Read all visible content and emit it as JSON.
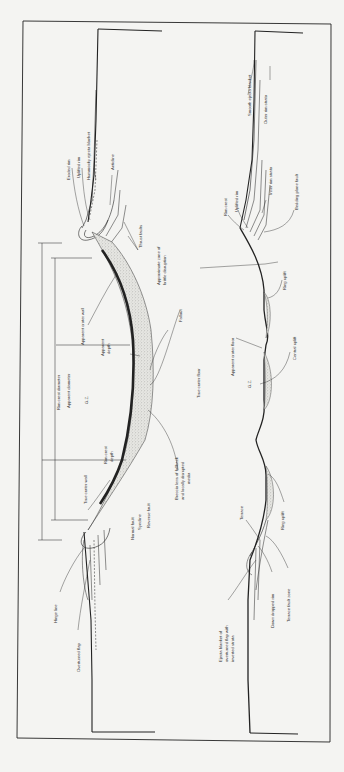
{
  "figure": {
    "orientation": "rotated 90deg counter-clockwise (ground surface runs vertically)",
    "frame": {
      "x1": 23,
      "y1": 21,
      "x2": 331,
      "y2": 742
    }
  },
  "left_crater": {
    "description": "Simple crater cross-section",
    "labels": {
      "eroded_rim": "Eroded rim",
      "uplifted_rim": "Uplifted rim",
      "hummocky": "Hummocky ejecta blanket",
      "anticline": "Anticline",
      "thrust_faults": "Thrust faults",
      "brittle_zone": "Approximate zone of brittle disruption",
      "fallout": "Fallout",
      "true_floor": "True crater floor",
      "breccia": "Breccia lens of fallback and locally disrupted media",
      "rim_crest_diameter": "Rim crest diameter",
      "apparent_diameter": "Apparent diameter",
      "gz": "G.Z.",
      "apparent_wall": "Apparent crater wall",
      "apparent_depth": "Apparent depth",
      "rim_crest_depth": "Rim crest depth",
      "true_wall": "True crater wall",
      "normal_fault": "Normal fault",
      "syncline": "Syncline",
      "reverse_fault": "Reverse fault",
      "hinge_line": "Hinge line",
      "overturned_flap": "Overturned flap"
    }
  },
  "right_crater": {
    "description": "Complex crater cross-section",
    "labels": {
      "smooth_ejecta": "Smooth ejecta blanket",
      "outer_rim_strata": "Outer rim strata",
      "rim_crest": "Rim crest",
      "uplifted_rim": "Uplifted rim",
      "inner_rim_strata": "Inner rim strata",
      "bedding_plane_fault": "Bedding plane fault",
      "ring_uplift_top": "Ring uplift",
      "apparent_floor": "Apparent crater floor",
      "central_uplift": "Central uplift",
      "gz": "G.Z.",
      "terrace": "Terrace",
      "ring_uplift_bottom": "Ring uplift",
      "ejecta_flap": "Ejecta blanket of overturned flap with inverted strata",
      "down_dropped_rim": "Down dropped rim",
      "terrace_fault_zone": "Terrace fault zone"
    }
  },
  "colors": {
    "paper": "#f4f4f2",
    "ink": "#222222",
    "breccia_fill": "#cfcfcb"
  }
}
